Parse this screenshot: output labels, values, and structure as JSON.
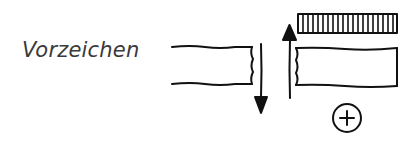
{
  "diagram": {
    "label": "Vorzeichen",
    "sign_symbol": "+",
    "elements": {
      "left_beam": "beam-section-cut-right",
      "down_arrow": "shear-force-down",
      "up_arrow": "shear-force-up",
      "hatched_bar": "hatched-stress-block",
      "right_beam": "beam-section-cut-left",
      "sign_circle": "plus-sign-circle"
    },
    "colors": {
      "stroke": "#111111",
      "text": "#3a3a3a",
      "background": "#ffffff"
    }
  }
}
